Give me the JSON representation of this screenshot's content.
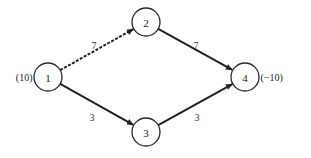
{
  "diagram": {
    "type": "network-flow-graph",
    "nodes": [
      {
        "id": "1",
        "label": "1",
        "x": 48,
        "y": 77,
        "supply_label": "(10)",
        "supply_side": "left"
      },
      {
        "id": "2",
        "label": "2",
        "x": 146,
        "y": 22,
        "supply_label": "",
        "supply_side": ""
      },
      {
        "id": "3",
        "label": "3",
        "x": 146,
        "y": 132,
        "supply_label": "",
        "supply_side": ""
      },
      {
        "id": "4",
        "label": "4",
        "x": 245,
        "y": 77,
        "supply_label": "(−10)",
        "supply_side": "right"
      }
    ],
    "edges": [
      {
        "from": "1",
        "to": "2",
        "label": "7",
        "style": "dashed",
        "label_x": 94,
        "label_y": 45
      },
      {
        "from": "2",
        "to": "4",
        "label": "7",
        "style": "solid",
        "label_x": 196,
        "label_y": 45
      },
      {
        "from": "1",
        "to": "3",
        "label": "3",
        "style": "solid",
        "label_x": 92,
        "label_y": 117
      },
      {
        "from": "3",
        "to": "4",
        "label": "3",
        "style": "solid",
        "label_x": 197,
        "label_y": 117
      }
    ],
    "node_radius": 14,
    "colors": {
      "stroke": "#222222",
      "background": "#ffffff"
    }
  }
}
